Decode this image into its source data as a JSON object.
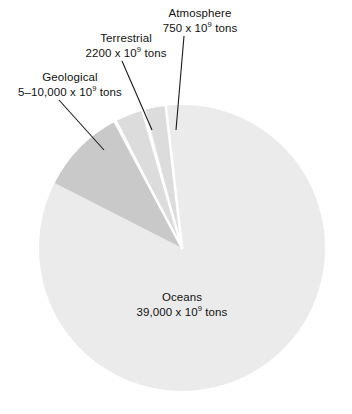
{
  "chart_data": {
    "type": "pie",
    "title": "",
    "unit": "x 10^9 tons",
    "categories": [
      "Oceans",
      "Geological",
      "Terrestrial",
      "Atmosphere"
    ],
    "values": [
      39000,
      7500,
      2200,
      750
    ],
    "value_labels": [
      "39,000 x 10⁹ tons",
      "5–10,000 x 10⁹ tons",
      "2200 x 10⁹ tons",
      "750 x 10⁹ tons"
    ],
    "legend": "none",
    "grid": false,
    "slices": [
      {
        "name": "Oceans",
        "value": 39000,
        "value_text": "39,000",
        "exponent": "9",
        "unit_prefix": " x 10",
        "unit_suffix": " tons",
        "color": "#ebebeb",
        "start_deg": 345,
        "end_deg": 657,
        "label_position": "inside"
      },
      {
        "name": "Geological",
        "value": 7500,
        "value_text": "5–10,000",
        "exponent": "9",
        "unit_prefix": " x 10",
        "unit_suffix": " tons",
        "color": "#c9c9c9",
        "start_deg": 297,
        "end_deg": 332,
        "label_position": "outside-left"
      },
      {
        "name": "Terrestrial",
        "value": 2200,
        "value_text": "2200",
        "exponent": "9",
        "unit_prefix": " x 10",
        "unit_suffix": " tons",
        "color": "#dcdcdc",
        "start_deg": 333,
        "end_deg": 344,
        "label_position": "outside-top"
      },
      {
        "name": "Atmosphere",
        "value": 750,
        "value_text": "750",
        "exponent": "9",
        "unit_prefix": " x 10",
        "unit_suffix": " tons",
        "color": "#dcdcdc",
        "start_deg": 345.5,
        "end_deg": 353.5,
        "label_position": "outside-top"
      }
    ],
    "colors": {
      "oceans": "#ebebeb",
      "geological": "#c9c9c9",
      "terrestrial": "#dcdcdc",
      "atmosphere": "#dcdcdc",
      "separator": "#ffffff",
      "leader_line": "#1a1a1a",
      "text": "#111111",
      "background": "#ffffff"
    },
    "geometry": {
      "cx": 182,
      "cy": 248,
      "r": 143
    }
  },
  "labels": {
    "atmosphere": {
      "line1": "Atmosphere",
      "value": "750",
      "unit_prefix": " x 10",
      "exponent": "9",
      "unit_suffix": " tons"
    },
    "terrestrial": {
      "line1": "Terrestrial",
      "value": "2200",
      "unit_prefix": " x 10",
      "exponent": "9",
      "unit_suffix": " tons"
    },
    "geological": {
      "line1": "Geological",
      "value": "5–10,000",
      "unit_prefix": " x 10",
      "exponent": "9",
      "unit_suffix": " tons"
    },
    "oceans": {
      "line1": "Oceans",
      "value": "39,000",
      "unit_prefix": " x 10",
      "exponent": "9",
      "unit_suffix": " tons"
    }
  }
}
